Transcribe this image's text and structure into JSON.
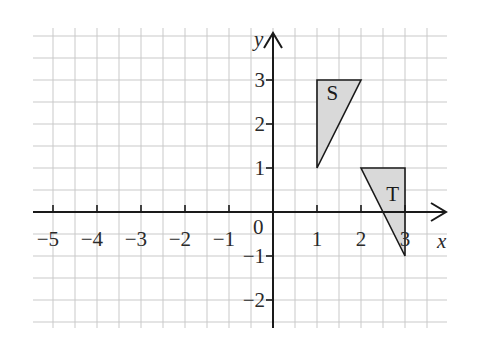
{
  "diagram": {
    "type": "coordinate-grid",
    "axes": {
      "x_label": "x",
      "y_label": "y",
      "origin_label": "0",
      "x_ticks": [
        {
          "value": -5,
          "label": "−5"
        },
        {
          "value": -4,
          "label": "−4"
        },
        {
          "value": -3,
          "label": "−3"
        },
        {
          "value": -2,
          "label": "−2"
        },
        {
          "value": -1,
          "label": "−1"
        },
        {
          "value": 1,
          "label": "1"
        },
        {
          "value": 2,
          "label": "2"
        },
        {
          "value": 3,
          "label": "3"
        }
      ],
      "y_ticks": [
        {
          "value": 3,
          "label": "3"
        },
        {
          "value": 2,
          "label": "2"
        },
        {
          "value": 1,
          "label": "1"
        },
        {
          "value": -1,
          "label": "−1"
        },
        {
          "value": -2,
          "label": "−2"
        }
      ],
      "x_range": [
        -5.5,
        4
      ],
      "y_range": [
        -2.6,
        4.2
      ],
      "grid_spacing": 0.5
    },
    "shapes": [
      {
        "name": "S",
        "label": "S",
        "vertices": [
          [
            1,
            1
          ],
          [
            1,
            3
          ],
          [
            2,
            3
          ]
        ],
        "fill": "#d9d9d9",
        "label_pos": [
          1.35,
          2.55
        ]
      },
      {
        "name": "T",
        "label": "T",
        "vertices": [
          [
            2,
            1
          ],
          [
            3,
            1
          ],
          [
            3,
            -1
          ]
        ],
        "fill": "#d9d9d9",
        "label_pos": [
          2.72,
          0.25
        ]
      }
    ]
  }
}
